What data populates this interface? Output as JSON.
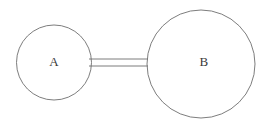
{
  "diagram": {
    "background_color": "#ffffff",
    "stroke_color": "#6e6e6e",
    "label_color": "#3a3a3a",
    "nodes": [
      {
        "id": "A",
        "label": "A",
        "shape": "circle",
        "cx": 54,
        "cy": 62.5,
        "r": 37.5
      },
      {
        "id": "B",
        "label": "B",
        "shape": "circle",
        "cx": 201,
        "cy": 64,
        "r": 54
      }
    ],
    "connector": {
      "type": "tube",
      "from": "A",
      "to": "B",
      "x_start": 89,
      "x_end": 148,
      "y_top": 59,
      "y_bottom": 66
    }
  }
}
